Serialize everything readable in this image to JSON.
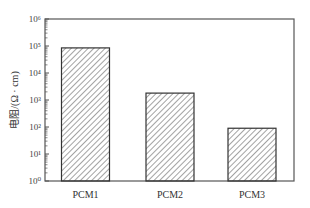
{
  "chart_data": {
    "type": "bar",
    "title": "",
    "xlabel": "",
    "ylabel": "电阻/(Ω · cm)",
    "yscale": "log",
    "ylim": [
      1,
      1000000
    ],
    "y_ticks": [
      "10⁰",
      "10¹",
      "10²",
      "10³",
      "10⁴",
      "10⁵",
      "10⁶"
    ],
    "categories": [
      "PCM1",
      "PCM2",
      "PCM3"
    ],
    "values": [
      85000,
      1800,
      90
    ],
    "grid": false,
    "legend": null,
    "bar_style": "hatched (diagonal lines), black outline, no fill"
  },
  "colors": {
    "axis": "#555555",
    "bar_edge": "#333333",
    "hatch": "#555555",
    "background": "#ffffff"
  }
}
